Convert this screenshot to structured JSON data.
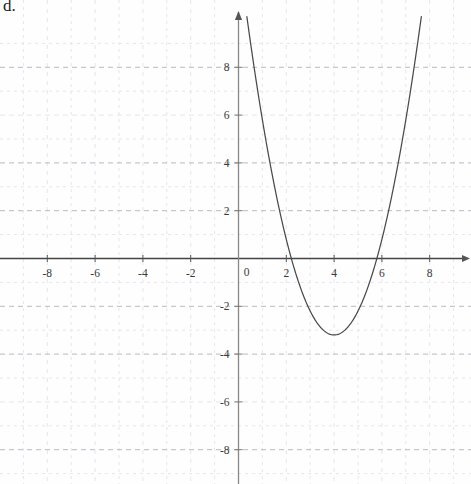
{
  "problem": {
    "label": "d."
  },
  "chart_data": {
    "type": "line",
    "title": "",
    "xlabel": "",
    "ylabel": "",
    "xlim": [
      -9.9,
      9.7
    ],
    "ylim": [
      -9.4,
      9.4
    ],
    "grid": true,
    "grid_step": 1,
    "grid_major_step": 2,
    "legend": "none",
    "axis_arrows": [
      "x-positive",
      "y-positive"
    ],
    "xticks": [
      -8,
      -6,
      -4,
      -2,
      0,
      2,
      4,
      6,
      8
    ],
    "xtick_labels": [
      "-8",
      "-6",
      "-4",
      "-2",
      "0",
      "2",
      "4",
      "6",
      "8"
    ],
    "yticks": [
      8,
      6,
      4,
      2,
      0,
      -2,
      -4,
      -6,
      -8
    ],
    "ytick_labels": [
      "8",
      "6",
      "4",
      "2",
      "0",
      "-2",
      "-4",
      "-6",
      "-8"
    ],
    "origin_label": "0",
    "series": [
      {
        "name": "parabola",
        "type": "quadratic",
        "equation": "y = x^2 - 8x + 12.8",
        "a": 1,
        "b": -8,
        "c": 12.8,
        "vertex": [
          4,
          -3.2
        ],
        "roots": [
          2.2,
          5.8
        ],
        "opens": "up",
        "color": "#4a4a4a",
        "x_domain": [
          0.35,
          7.65
        ],
        "points": [
          [
            0.35,
            10.12
          ],
          [
            0.6,
            8.36
          ],
          [
            1.0,
            5.8
          ],
          [
            1.4,
            3.56
          ],
          [
            1.8,
            1.64
          ],
          [
            2.2,
            0.04
          ],
          [
            2.6,
            -1.24
          ],
          [
            3.0,
            -2.2
          ],
          [
            3.4,
            -2.84
          ],
          [
            3.8,
            -3.16
          ],
          [
            4.0,
            -3.2
          ],
          [
            4.2,
            -3.16
          ],
          [
            4.6,
            -2.84
          ],
          [
            5.0,
            -2.2
          ],
          [
            5.4,
            -1.24
          ],
          [
            5.8,
            0.04
          ],
          [
            6.2,
            1.64
          ],
          [
            6.6,
            3.56
          ],
          [
            7.0,
            5.8
          ],
          [
            7.4,
            8.36
          ],
          [
            7.65,
            10.12
          ]
        ]
      }
    ],
    "colors": {
      "curve": "#4a4a4a",
      "axis": "#5a5a5a",
      "grid_major": "#b9b9c4",
      "grid_minor": "#e6e6ec",
      "tick_text": "#3a3a3a",
      "background": "#fefefe"
    }
  }
}
